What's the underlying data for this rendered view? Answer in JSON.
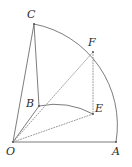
{
  "figure": {
    "canvas": {
      "width": 132,
      "height": 167
    },
    "background_color": "#ffffff",
    "stroke_color": "#6e6e6e",
    "dotted_stroke_color": "#8c8c8c",
    "label_color": "#2b2b2b",
    "points": [
      {
        "id": "O",
        "label": "O",
        "x": 13,
        "y": 142,
        "label_x": 6,
        "label_y": 146
      },
      {
        "id": "A",
        "label": "A",
        "x": 116,
        "y": 142,
        "label_x": 112,
        "label_y": 146
      },
      {
        "id": "B",
        "label": "B",
        "x": 39,
        "y": 106,
        "label_x": 26,
        "label_y": 98
      },
      {
        "id": "C",
        "label": "C",
        "x": 34,
        "y": 24,
        "label_x": 27,
        "label_y": 9
      },
      {
        "id": "E",
        "label": "E",
        "x": 93,
        "y": 114,
        "label_x": 95,
        "label_y": 103
      },
      {
        "id": "F",
        "label": "F",
        "x": 93,
        "y": 52,
        "label_x": 88,
        "label_y": 37
      }
    ],
    "segments": [
      {
        "id": "OA",
        "from": "O",
        "to": "A",
        "style": "solid"
      },
      {
        "id": "OC",
        "from": "O",
        "to": "C",
        "style": "solid"
      },
      {
        "id": "OB",
        "from": "O",
        "to": "B",
        "style": "solid"
      },
      {
        "id": "CB",
        "from": "C",
        "to": "B",
        "style": "solid"
      },
      {
        "id": "OF",
        "from": "O",
        "to": "F",
        "style": "dotted"
      },
      {
        "id": "OE",
        "from": "O",
        "to": "E",
        "style": "dotted"
      },
      {
        "id": "FE",
        "from": "F",
        "to": "E",
        "style": "dotted"
      }
    ],
    "arcs": [
      {
        "id": "arc-A-F-C",
        "from": "A",
        "to": "C",
        "radius": 103,
        "style": "solid"
      },
      {
        "id": "arc-E-B",
        "from": "E",
        "to": "B",
        "radius": 80,
        "style": "solid"
      }
    ]
  }
}
